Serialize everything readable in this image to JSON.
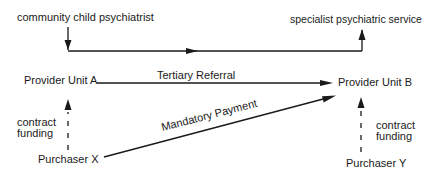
{
  "diagram": {
    "nodes": {
      "community_child_psychiatrist": "community child psychiatrist",
      "specialist_psychiatric_service": "specialist psychiatric service",
      "provider_unit_a": "Provider Unit A",
      "provider_unit_b": "Provider Unit B",
      "purchaser_x": "Purchaser X",
      "purchaser_y": "Purchaser Y"
    },
    "edges": {
      "tertiary_referral": "Tertiary  Referral",
      "mandatory_payment": "Mandatory Payment",
      "contract_funding_left_line1": "contract",
      "contract_funding_left_line2": "funding",
      "contract_funding_right_line1": "contract",
      "contract_funding_right_line2": "funding"
    },
    "colors": {
      "line": "#1a1a1a",
      "text": "#1a1a1a",
      "background": "#ffffff"
    }
  }
}
